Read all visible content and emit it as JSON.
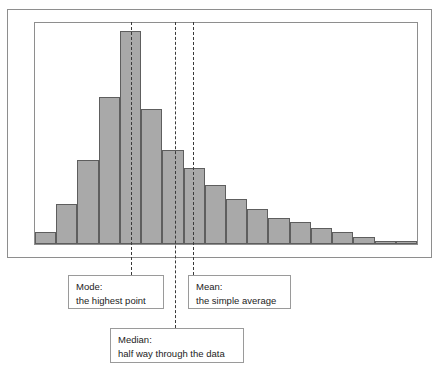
{
  "figure": {
    "name": "histogram-with-mean-median-mode",
    "bar_fill": "#a9a9a9",
    "bar_stroke": "#5e5e5e",
    "frame_color": "#8e8e8e",
    "marker_color": "#3a3a3a"
  },
  "chart_data": {
    "type": "bar",
    "title": "",
    "xlabel": "",
    "ylabel": "",
    "grid": false,
    "legend": "none",
    "axis_ticks_visible": false,
    "categories": [
      "1",
      "2",
      "3",
      "4",
      "5",
      "6",
      "7",
      "8",
      "9",
      "10",
      "11",
      "12",
      "13",
      "14",
      "15",
      "16",
      "17",
      "18"
    ],
    "values": [
      8,
      27,
      57,
      100,
      145,
      92,
      64,
      52,
      40,
      31,
      24,
      18,
      15,
      11,
      8,
      5,
      2,
      2
    ],
    "ylim": [
      0,
      150
    ],
    "annotations": [
      {
        "name": "mode",
        "label": "Mode",
        "x_fraction": 0.2526,
        "note": "the highest point"
      },
      {
        "name": "median",
        "label": "Median",
        "x_fraction": 0.3672,
        "note": "half way through the data"
      },
      {
        "name": "mean",
        "label": "Mean",
        "x_fraction": 0.4141,
        "note": "the simple average"
      }
    ]
  },
  "callouts": {
    "mode": {
      "title": "Mode:",
      "text": "the highest point"
    },
    "median": {
      "title": "Median:",
      "text": "half way through the data"
    },
    "mean": {
      "title": "Mean:",
      "text": "the simple average"
    }
  }
}
